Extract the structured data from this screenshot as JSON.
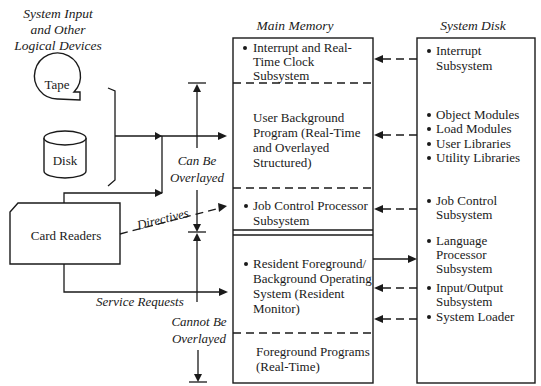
{
  "diagram": {
    "devices": {
      "title_lines": [
        "System Input",
        "and Other",
        "Logical Devices"
      ],
      "tape": "Tape",
      "disk": "Disk",
      "card_readers": "Card Readers"
    },
    "main_memory": {
      "title": "Main Memory",
      "sections": [
        {
          "bullet": true,
          "lines": [
            "Interrupt and Real-",
            "Time Clock",
            "Subsystem"
          ]
        },
        {
          "bullet": false,
          "lines": [
            "User Background",
            "Program (Real-Time",
            "and Overlayed",
            "Structured)"
          ]
        },
        {
          "bullet": true,
          "lines": [
            "Job Control Processor",
            "Subsystem"
          ]
        },
        {
          "bullet": true,
          "lines": [
            "Resident Foreground/",
            "Background Operating",
            "System (Resident",
            "Monitor)"
          ]
        },
        {
          "bullet": false,
          "lines": [
            "Foreground Programs",
            "(Real-Time)"
          ]
        }
      ]
    },
    "system_disk": {
      "title": "System Disk",
      "items": [
        {
          "lines": [
            "Interrupt",
            "Subsystem"
          ]
        },
        {
          "lines": [
            "Object Modules"
          ]
        },
        {
          "lines": [
            "Load Modules"
          ]
        },
        {
          "lines": [
            "User Libraries"
          ]
        },
        {
          "lines": [
            "Utility Libraries"
          ]
        },
        {
          "lines": [
            "Job Control",
            "Subsystem"
          ]
        },
        {
          "lines": [
            "Language",
            "Processor",
            "Subsystem"
          ]
        },
        {
          "lines": [
            "Input/Output",
            "Subsystem"
          ]
        },
        {
          "lines": [
            "System Loader"
          ]
        }
      ]
    },
    "annotations": {
      "can_be_overlayed": [
        "Can Be",
        "Overlayed"
      ],
      "cannot_be_overlayed": [
        "Cannot Be",
        "Overlayed"
      ],
      "directives": "Directives",
      "service_requests": "Service Requests"
    }
  }
}
